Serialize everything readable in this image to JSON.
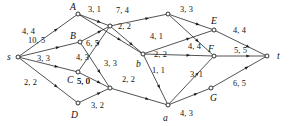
{
  "figure": {
    "kind": "flow-network-diagram",
    "width": 291,
    "height": 126,
    "stroke_color": "#1a1a1a",
    "background_color": "#ffffff",
    "label_format": "capacity, flow"
  },
  "nodes": [
    {
      "id": "s",
      "label": "s",
      "x": 18,
      "y": 57,
      "label_x": 7,
      "label_y": 52
    },
    {
      "id": "A",
      "label": "A",
      "x": 78,
      "y": 14,
      "label_x": 70,
      "label_y": 2
    },
    {
      "id": "B",
      "label": "B",
      "x": 80,
      "y": 42,
      "label_x": 70,
      "label_y": 31
    },
    {
      "id": "C",
      "label": "C",
      "x": 78,
      "y": 72,
      "label_x": 67,
      "label_y": 75
    },
    {
      "id": "D",
      "label": "D",
      "x": 78,
      "y": 103,
      "label_x": 71,
      "label_y": 110
    },
    {
      "id": "n1",
      "label": "",
      "x": 110,
      "y": 26,
      "label_x": 0,
      "label_y": 0
    },
    {
      "id": "n2",
      "label": "",
      "x": 110,
      "y": 88,
      "label_x": 0,
      "label_y": 0
    },
    {
      "id": "n3",
      "label": "",
      "x": 168,
      "y": 14,
      "label_x": 0,
      "label_y": 0
    },
    {
      "id": "b",
      "label": "b",
      "x": 143,
      "y": 54,
      "label_x": 136,
      "label_y": 59
    },
    {
      "id": "a",
      "label": "a",
      "x": 168,
      "y": 105,
      "label_x": 163,
      "label_y": 113
    },
    {
      "id": "E",
      "label": "E",
      "x": 214,
      "y": 30,
      "label_x": 211,
      "label_y": 16
    },
    {
      "id": "F",
      "label": "F",
      "x": 214,
      "y": 56,
      "label_x": 208,
      "label_y": 44
    },
    {
      "id": "G",
      "label": "G",
      "x": 211,
      "y": 88,
      "label_x": 210,
      "label_y": 93
    },
    {
      "id": "t",
      "label": "t",
      "x": 267,
      "y": 56,
      "label_x": 277,
      "label_y": 51
    }
  ],
  "edges": [
    {
      "from": "s",
      "to": "A",
      "capacity": 4,
      "flow": 4,
      "label": "4, 4",
      "label_x": 22,
      "label_y": 28
    },
    {
      "from": "s",
      "to": "B",
      "capacity": 10,
      "flow": 5,
      "label": "10, 5",
      "label_x": 28,
      "label_y": 37
    },
    {
      "from": "s",
      "to": "C",
      "capacity": 3,
      "flow": 3,
      "label": "3, 3",
      "label_x": 37,
      "label_y": 55
    },
    {
      "from": "s",
      "to": "D",
      "capacity": 2,
      "flow": 2,
      "label": "2, 2",
      "label_x": 24,
      "label_y": 79
    },
    {
      "from": "A",
      "to": "n1",
      "capacity": 3,
      "flow": 1,
      "label": "3, 1",
      "label_x": 88,
      "label_y": 6
    },
    {
      "from": "A",
      "to": "b",
      "capacity": 3,
      "flow": 3,
      "label": "3, 3",
      "label_x": 104,
      "label_y": 60
    },
    {
      "from": "B",
      "to": "n1",
      "capacity": 6,
      "flow": 5,
      "label": "6, 5",
      "label_x": 86,
      "label_y": 40
    },
    {
      "from": "B",
      "to": "n2",
      "capacity": 4,
      "flow": 3,
      "label": "4, 3",
      "label_x": 76,
      "label_y": 54
    },
    {
      "from": "C",
      "to": "n1",
      "capacity": 5,
      "flow": 0,
      "label": "5, 0",
      "label_x": 77,
      "label_y": 78
    },
    {
      "from": "C",
      "to": "n2",
      "capacity": 5,
      "flow": 0,
      "label": "5, 0",
      "label_x": 77,
      "label_y": 78
    },
    {
      "from": "D",
      "to": "n2",
      "capacity": 3,
      "flow": 2,
      "label": "3, 2",
      "label_x": 91,
      "label_y": 102
    },
    {
      "from": "n1",
      "to": "n3",
      "capacity": 7,
      "flow": 4,
      "label": "7, 4",
      "label_x": 116,
      "label_y": 7
    },
    {
      "from": "n1",
      "to": "b",
      "capacity": 2,
      "flow": 2,
      "label": "2, 2",
      "label_x": 118,
      "label_y": 23
    },
    {
      "from": "n2",
      "to": "a",
      "capacity": 2,
      "flow": 2,
      "label": "2, 2",
      "label_x": 122,
      "label_y": 76
    },
    {
      "from": "n3",
      "to": "E",
      "capacity": 3,
      "flow": 3,
      "label": "3, 3",
      "label_x": 180,
      "label_y": 6
    },
    {
      "from": "n3",
      "to": "F",
      "capacity": 4,
      "flow": 4,
      "label": "4, 4",
      "label_x": 188,
      "label_y": 43
    },
    {
      "from": "b",
      "to": "E",
      "capacity": 4,
      "flow": 1,
      "label": "4, 1",
      "label_x": 150,
      "label_y": 33
    },
    {
      "from": "b",
      "to": "F",
      "capacity": 2,
      "flow": 2,
      "label": "2, 2",
      "label_x": 154,
      "label_y": 51
    },
    {
      "from": "b",
      "to": "a",
      "capacity": 1,
      "flow": 1,
      "label": "1, 1",
      "label_x": 152,
      "label_y": 67
    },
    {
      "from": "a",
      "to": "F",
      "capacity": 3,
      "flow": 1,
      "label": "3, 1",
      "label_x": 190,
      "label_y": 71
    },
    {
      "from": "a",
      "to": "G",
      "capacity": 4,
      "flow": 3,
      "label": "4, 3",
      "label_x": 180,
      "label_y": 110
    },
    {
      "from": "E",
      "to": "t",
      "capacity": 4,
      "flow": 4,
      "label": "4, 4",
      "label_x": 233,
      "label_y": 27
    },
    {
      "from": "F",
      "to": "t",
      "capacity": 5,
      "flow": 5,
      "label": "5, 5",
      "label_x": 234,
      "label_y": 47
    },
    {
      "from": "G",
      "to": "t",
      "capacity": 6,
      "flow": 5,
      "label": "6, 5",
      "label_x": 233,
      "label_y": 80
    }
  ]
}
